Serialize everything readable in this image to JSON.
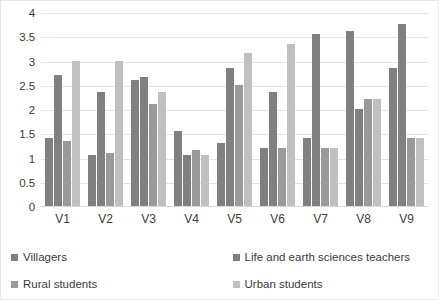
{
  "chart_data": {
    "type": "bar",
    "title": "",
    "xlabel": "",
    "ylabel": "",
    "ylim": [
      0,
      4
    ],
    "grid": true,
    "legend_position": "bottom",
    "categories": [
      "V1",
      "V2",
      "V3",
      "V4",
      "V5",
      "V6",
      "V7",
      "V8",
      "V9"
    ],
    "yticks": [
      "0",
      "0.5",
      "1",
      "1.5",
      "2",
      "2.5",
      "3",
      "3.5",
      "4"
    ],
    "series": [
      {
        "name": "Villagers",
        "color": "#808080",
        "values": [
          1.4,
          1.05,
          2.6,
          1.55,
          1.3,
          1.2,
          1.4,
          3.6,
          2.85
        ]
      },
      {
        "name": "Life and earth sciences teachers",
        "color": "#808080",
        "values": [
          2.7,
          2.35,
          2.65,
          1.05,
          2.85,
          2.35,
          3.55,
          2.0,
          3.75
        ]
      },
      {
        "name": "Rural students",
        "color": "#9a9a9a",
        "values": [
          1.35,
          1.1,
          2.1,
          1.15,
          2.5,
          1.2,
          1.2,
          2.2,
          1.4
        ]
      },
      {
        "name": "Urban students",
        "color": "#c0c0c0",
        "values": [
          3.0,
          3.0,
          2.35,
          1.05,
          3.15,
          3.35,
          1.2,
          2.2,
          1.4
        ]
      }
    ]
  }
}
